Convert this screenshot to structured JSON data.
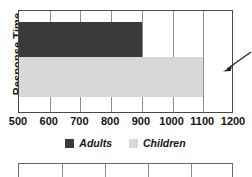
{
  "chart_data": {
    "type": "bar",
    "orientation": "horizontal",
    "title": "",
    "xlabel": "",
    "ylabel": "Response Time",
    "xlim": [
      500,
      1200
    ],
    "xticks": [
      500,
      600,
      700,
      800,
      900,
      1000,
      1100,
      1200
    ],
    "xticklabels": [
      "500",
      "600",
      "700",
      "800",
      "900",
      "1000",
      "1100",
      "1200"
    ],
    "grid": true,
    "legend_position": "bottom-center",
    "categories": [
      "Response Time"
    ],
    "series": [
      {
        "name": "Adults",
        "values": [
          900
        ],
        "color": "#3a3a3a"
      },
      {
        "name": "Children",
        "values": [
          1100
        ],
        "color": "#d8d8d8"
      }
    ],
    "annotations": [
      {
        "name": "pointer-arrow",
        "symbol": "arrow",
        "direction": "down-left",
        "text": ""
      }
    ]
  },
  "legend": {
    "items": [
      {
        "label": "Adults",
        "color": "#3a3a3a"
      },
      {
        "label": "Children",
        "color": "#d8d8d8"
      }
    ]
  },
  "colors": {
    "adults": "#3a3a3a",
    "children": "#d8d8d8",
    "frame": "#4a4a4a",
    "gridline": "#8e8e8e",
    "text": "#141414",
    "background": "#ffffff"
  }
}
